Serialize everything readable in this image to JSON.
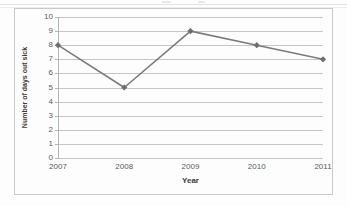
{
  "chart_data": {
    "type": "line",
    "title": "",
    "xlabel": "Year",
    "ylabel": "Number of days out sick",
    "categories": [
      "2007",
      "2008",
      "2009",
      "2010",
      "2011"
    ],
    "values": [
      8,
      5,
      9,
      8,
      7
    ],
    "series": [
      {
        "name": "Number of days out sick",
        "values": [
          8,
          5,
          9,
          8,
          7
        ]
      }
    ],
    "ylim": [
      0,
      10
    ],
    "y_ticks": [
      0,
      1,
      2,
      3,
      4,
      5,
      6,
      7,
      8,
      9,
      10
    ],
    "y_tick_labels": [
      "0",
      "1",
      "2",
      "3",
      "4",
      "5",
      "6",
      "7",
      "8",
      "9",
      "10"
    ],
    "grid": true,
    "grid_axis": "y",
    "legend": false,
    "legend_position": "none",
    "marker": "diamond",
    "line_color": "#7b7b7b",
    "marker_color": "#6e6e6e",
    "grid_color": "#c5c5c5",
    "axis_color": "#b4b4b4",
    "tick_label_color": "#59595b",
    "axis_title_color": "#3b3b3b",
    "plot_background": "#fdfdfd",
    "frame_color": "#c9c9c9"
  }
}
